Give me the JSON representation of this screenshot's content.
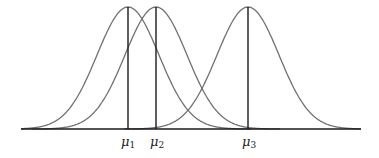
{
  "chart_data": {
    "type": "line",
    "title": "",
    "xlabel": "",
    "ylabel": "",
    "series": [
      {
        "name": "μ1",
        "mean_label": "μ",
        "mean_sub": "1",
        "mean_px": 128
      },
      {
        "name": "μ2",
        "mean_label": "μ",
        "mean_sub": "2",
        "mean_px": 156
      },
      {
        "name": "μ3",
        "mean_label": "μ",
        "mean_sub": "3",
        "mean_px": 248
      }
    ],
    "sigma_px": 31,
    "axis": {
      "x_start": 21,
      "x_end": 361,
      "y": 129,
      "peak_y": 7
    },
    "grid": false,
    "legend": "none"
  },
  "labels": {
    "mu1": {
      "main": "μ",
      "sub": "1"
    },
    "mu2": {
      "main": "μ",
      "sub": "2"
    },
    "mu3": {
      "main": "μ",
      "sub": "3"
    }
  }
}
